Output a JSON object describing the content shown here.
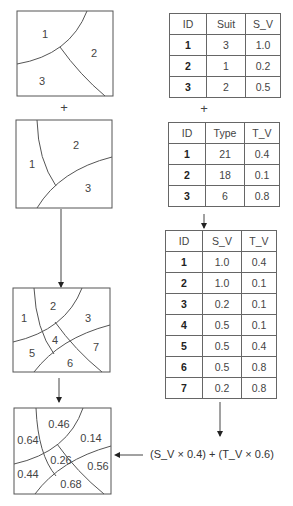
{
  "map_suitability": {
    "polygons": [
      {
        "id": "1",
        "x": 45,
        "y": 34
      },
      {
        "id": "2",
        "x": 94,
        "y": 53
      },
      {
        "id": "3",
        "x": 42,
        "y": 81
      }
    ]
  },
  "plus_1": "+",
  "map_type": {
    "polygons": [
      {
        "id": "1",
        "x": 32,
        "y": 164
      },
      {
        "id": "2",
        "x": 76,
        "y": 145
      },
      {
        "id": "3",
        "x": 88,
        "y": 188
      }
    ]
  },
  "map_overlay": {
    "polygons": [
      {
        "id": "1",
        "x": 24,
        "y": 318
      },
      {
        "id": "2",
        "x": 53,
        "y": 306
      },
      {
        "id": "3",
        "x": 88,
        "y": 318
      },
      {
        "id": "4",
        "x": 55,
        "y": 340
      },
      {
        "id": "5",
        "x": 32,
        "y": 353
      },
      {
        "id": "6",
        "x": 70,
        "y": 363
      },
      {
        "id": "7",
        "x": 96,
        "y": 347
      }
    ]
  },
  "map_result": {
    "values": [
      {
        "label": "0.46",
        "x": 59,
        "y": 424
      },
      {
        "label": "0.64",
        "x": 28,
        "y": 440
      },
      {
        "label": "0.14",
        "x": 91,
        "y": 438
      },
      {
        "label": "0.26",
        "x": 61,
        "y": 460
      },
      {
        "label": "0.56",
        "x": 98,
        "y": 466
      },
      {
        "label": "0.44",
        "x": 28,
        "y": 474
      },
      {
        "label": "0.68",
        "x": 71,
        "y": 484
      }
    ]
  },
  "table_suitability": {
    "headers": [
      "ID",
      "Suit",
      "S_V"
    ],
    "rows": [
      [
        "1",
        "3",
        "1.0"
      ],
      [
        "2",
        "1",
        "0.2"
      ],
      [
        "3",
        "2",
        "0.5"
      ]
    ]
  },
  "plus_2": "+",
  "table_type": {
    "headers": [
      "ID",
      "Type",
      "T_V"
    ],
    "rows": [
      [
        "1",
        "21",
        "0.4"
      ],
      [
        "2",
        "18",
        "0.1"
      ],
      [
        "3",
        "6",
        "0.8"
      ]
    ]
  },
  "table_combined": {
    "headers": [
      "ID",
      "S_V",
      "T_V"
    ],
    "rows": [
      [
        "1",
        "1.0",
        "0.4"
      ],
      [
        "2",
        "1.0",
        "0.1"
      ],
      [
        "3",
        "0.2",
        "0.1"
      ],
      [
        "4",
        "0.5",
        "0.1"
      ],
      [
        "5",
        "0.5",
        "0.4"
      ],
      [
        "6",
        "0.5",
        "0.8"
      ],
      [
        "7",
        "0.2",
        "0.8"
      ]
    ]
  },
  "formula": "(S_V × 0.4) + (T_V × 0.6)"
}
